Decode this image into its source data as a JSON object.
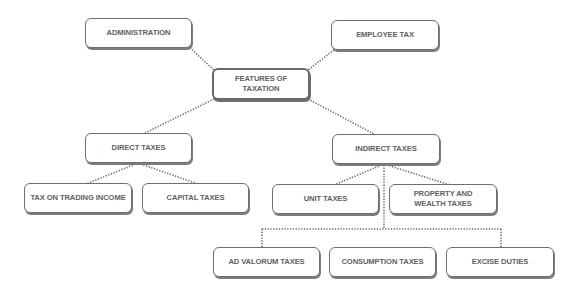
{
  "diagram": {
    "type": "hierarchy",
    "root": {
      "label": "FEATURES OF TAXATION"
    },
    "nodes": {
      "administration": "ADMINISTRATION",
      "employee_tax": "EMPLOYEE TAX",
      "features": "FEATURES OF TAXATION",
      "direct_taxes": "DIRECT TAXES",
      "indirect_taxes": "INDIRECT TAXES",
      "tax_on_trading_income": "TAX ON TRADING INCOME",
      "capital_taxes": "CAPITAL TAXES",
      "unit_taxes": "UNIT TAXES",
      "property_and_wealth_taxes": "PROPERTY AND WEALTH TAXES",
      "ad_valorum_taxes": "AD VALORUM TAXES",
      "consumption_taxes": "CONSUMPTION TAXES",
      "excise_duties": "EXCISE DUTIES"
    },
    "edges": [
      [
        "FEATURES OF TAXATION",
        "ADMINISTRATION"
      ],
      [
        "FEATURES OF TAXATION",
        "EMPLOYEE TAX"
      ],
      [
        "FEATURES OF TAXATION",
        "DIRECT TAXES"
      ],
      [
        "FEATURES OF TAXATION",
        "INDIRECT TAXES"
      ],
      [
        "DIRECT TAXES",
        "TAX ON TRADING INCOME"
      ],
      [
        "DIRECT TAXES",
        "CAPITAL TAXES"
      ],
      [
        "INDIRECT TAXES",
        "UNIT TAXES"
      ],
      [
        "INDIRECT TAXES",
        "PROPERTY AND WEALTH TAXES"
      ],
      [
        "INDIRECT TAXES",
        "AD VALORUM TAXES"
      ],
      [
        "INDIRECT TAXES",
        "CONSUMPTION TAXES"
      ],
      [
        "INDIRECT TAXES",
        "EXCISE DUTIES"
      ]
    ],
    "colors": {
      "border": "#6f6f6f",
      "text": "#5f5f5f",
      "connector": "#6e6e6e",
      "background": "#ffffff"
    }
  }
}
